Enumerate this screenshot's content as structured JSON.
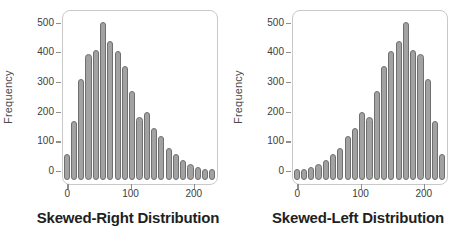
{
  "chart_data": [
    {
      "type": "bar",
      "title": "Skewed-Right Distribution",
      "xlabel": "",
      "ylabel": "Frequency",
      "values": [
        60,
        170,
        310,
        395,
        410,
        505,
        440,
        405,
        355,
        270,
        185,
        200,
        145,
        120,
        80,
        60,
        40,
        25,
        15,
        10,
        10
      ],
      "bins": 21,
      "x_range": [
        -6,
        236
      ],
      "x_ticks": [
        0,
        100,
        200
      ],
      "y_ticks": [
        0,
        100,
        200,
        300,
        400,
        500
      ],
      "y_range": [
        0,
        540
      ],
      "grid": false,
      "legend": "none",
      "bar_color": "#a2a2a2",
      "bar_border_color": "#6f6f6f",
      "frame_color": "#c9c9c9",
      "bar_shape": "capsule"
    },
    {
      "type": "bar",
      "title": "Skewed-Left Distribution",
      "xlabel": "",
      "ylabel": "Frequency",
      "values": [
        10,
        10,
        15,
        25,
        40,
        60,
        80,
        120,
        145,
        200,
        185,
        270,
        355,
        405,
        440,
        505,
        410,
        395,
        310,
        170,
        60
      ],
      "bins": 21,
      "x_range": [
        -6,
        236
      ],
      "x_ticks": [
        0,
        100,
        200
      ],
      "y_ticks": [
        0,
        100,
        200,
        300,
        400,
        500
      ],
      "y_range": [
        0,
        540
      ],
      "grid": false,
      "legend": "none",
      "bar_color": "#a2a2a2",
      "bar_border_color": "#6f6f6f",
      "frame_color": "#c9c9c9",
      "bar_shape": "capsule"
    }
  ]
}
